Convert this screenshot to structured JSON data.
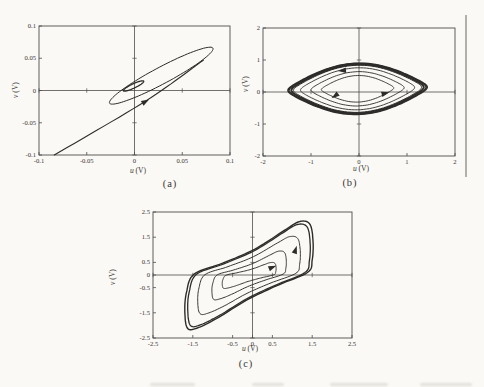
{
  "page": {
    "background": "#faf9f5",
    "ink": "#2e2c2a",
    "frame_color": "#4f4d4a",
    "label_color": "#3a3733"
  },
  "chart_data": [
    {
      "id": "a",
      "type": "line",
      "subtype": "phase-portrait",
      "caption": "(a)",
      "xlabel": {
        "var": "u",
        "unit": " (V)"
      },
      "ylabel": {
        "var": "v",
        "unit": " (V)"
      },
      "xlim": [
        -0.1,
        0.1
      ],
      "ylim": [
        -0.1,
        0.1
      ],
      "frame_px": {
        "l": 39,
        "t": 26,
        "r": 230,
        "b": 155
      },
      "x_ticks": {
        "values": [
          -0.1,
          -0.05,
          0,
          0.05,
          0.1
        ],
        "labels": [
          "-0.1",
          "-0.05",
          "0",
          "0.05",
          "0.1"
        ]
      },
      "y_ticks": {
        "values": [
          0.1,
          0.05,
          0,
          -0.05,
          -0.1
        ],
        "labels": [
          "0.1",
          "0.05",
          "0",
          "-0.05",
          "-0.1"
        ]
      },
      "label_pos": {
        "xlabel": [
          138,
          167
        ],
        "ylabel": [
          16,
          90
        ],
        "caption": [
          170,
          179
        ]
      },
      "series": [
        {
          "name": "transient-line",
          "type": "segment",
          "width": 1.1,
          "points": [
            [
              -0.084,
              -0.1
            ],
            [
              0.0115,
              -0.0165
            ],
            [
              0.072,
              0.047
            ]
          ]
        },
        {
          "name": "outer-ellipse-orbit",
          "type": "ellipse",
          "width": 1.0,
          "cx": 0.028,
          "cy": 0.023,
          "rx": 0.069,
          "ry": 0.0115,
          "angle_deg": 38.8
        },
        {
          "name": "inner-ellipse-orbit",
          "type": "ellipse",
          "width": 1.3,
          "cx": -0.001,
          "cy": 0.007,
          "rx": 0.013,
          "ry": 0.003,
          "angle_deg": 36
        }
      ],
      "arrows": [
        {
          "x": 0.0115,
          "y": -0.017,
          "dir_deg": 30
        }
      ]
    },
    {
      "id": "b",
      "type": "line",
      "subtype": "phase-portrait",
      "caption": "(b)",
      "xlabel": {
        "var": "u",
        "unit": " (V)"
      },
      "ylabel": {
        "var": "v",
        "unit": " (V)"
      },
      "xlim": [
        -2,
        2
      ],
      "ylim": [
        -2,
        2
      ],
      "frame_px": {
        "l": 263,
        "t": 28,
        "r": 455,
        "b": 156
      },
      "x_ticks": {
        "values": [
          -2,
          -1,
          0,
          1,
          2
        ],
        "labels": [
          "-2",
          "-1",
          "0",
          "1",
          "2"
        ]
      },
      "y_ticks": {
        "values": [
          2,
          1,
          0,
          -1,
          -2
        ],
        "labels": [
          "2",
          "1",
          "0",
          "-1",
          "-2"
        ]
      },
      "label_pos": {
        "xlabel": [
          361,
          165
        ],
        "ylabel": [
          246,
          84
        ],
        "caption": [
          350,
          178
        ]
      },
      "series": [
        {
          "name": "limit-cycle-spiral",
          "type": "lens_spiral",
          "cx": -0.03,
          "cy": 0.1,
          "rx": 1.45,
          "ry": 0.8,
          "pinch": 0.55,
          "tilt": 0.05,
          "loops": [
            {
              "s": 0.52,
              "w": 0.9
            },
            {
              "s": 0.67,
              "w": 0.9
            },
            {
              "s": 0.82,
              "w": 0.9
            },
            {
              "s": 0.92,
              "w": 1.0
            },
            {
              "s": 0.955,
              "w": 1.5
            },
            {
              "s": 0.985,
              "w": 1.5
            },
            {
              "s": 1.0,
              "w": 1.6
            },
            {
              "s": 0.945,
              "w": 1.2
            }
          ]
        }
      ],
      "arrows": [
        {
          "x": -0.35,
          "y": 0.67,
          "dir_deg": 185
        },
        {
          "x": -0.5,
          "y": -0.12,
          "dir_deg": 215
        },
        {
          "x": 0.55,
          "y": -0.04,
          "dir_deg": 15
        }
      ]
    },
    {
      "id": "c",
      "type": "line",
      "subtype": "phase-portrait",
      "caption": "(c)",
      "xlabel": {
        "var": "u",
        "unit": " (V)"
      },
      "ylabel": {
        "var": "v",
        "unit": " (V)"
      },
      "xlim": [
        -2.5,
        2.5
      ],
      "ylim": [
        -2.5,
        2.5
      ],
      "frame_px": {
        "l": 153,
        "t": 212,
        "r": 352,
        "b": 338
      },
      "x_ticks": {
        "values": [
          -2.5,
          -1.5,
          -0.5,
          0,
          0.5,
          1.5,
          2.5
        ],
        "labels": [
          "-2.5",
          "-1.5",
          "-0.5",
          "0",
          "0.5",
          "1.5",
          "2.5"
        ]
      },
      "y_ticks": {
        "values": [
          2.5,
          1.5,
          0.5,
          0,
          -0.5,
          -1.5,
          -2.5
        ],
        "labels": [
          "2.5",
          "1.5",
          "0.5",
          "0",
          "-0.5",
          "-1.5",
          "-2.5"
        ]
      },
      "label_pos": {
        "xlabel": [
          250,
          345
        ],
        "ylabel": [
          113,
          277
        ],
        "caption": [
          246,
          359
        ]
      },
      "series": [
        {
          "name": "limit-cycle-spiral",
          "type": "loop_spiral",
          "cx": -0.08,
          "cy": -0.02,
          "base": [
            [
              -1.47,
              0.03
            ],
            [
              -0.75,
              0.47
            ],
            [
              0.05,
              1.02
            ],
            [
              0.8,
              1.77
            ],
            [
              1.18,
              2.12
            ],
            [
              1.44,
              2.02
            ],
            [
              1.52,
              1.35
            ],
            [
              1.5,
              0.6
            ],
            [
              1.38,
              0.1
            ],
            [
              0.6,
              -0.43
            ],
            [
              -0.15,
              -1.0
            ],
            [
              -0.85,
              -1.68
            ],
            [
              -1.35,
              -2.08
            ],
            [
              -1.63,
              -2.12
            ],
            [
              -1.7,
              -1.45
            ],
            [
              -1.66,
              -0.7
            ]
          ],
          "loops": [
            {
              "sx": 1.0,
              "sy": 1.0,
              "w": 1.4
            },
            {
              "sx": 0.955,
              "sy": 0.945,
              "w": 1.3
            },
            {
              "sx": 0.8,
              "sy": 0.72,
              "w": 0.95
            },
            {
              "sx": 0.58,
              "sy": 0.45,
              "w": 0.95
            },
            {
              "sx": 0.42,
              "sy": 0.24,
              "w": 0.95
            }
          ]
        }
      ],
      "arrows": [
        {
          "x": 0.5,
          "y": 0.3,
          "dir_deg": 22
        },
        {
          "x": 1.08,
          "y": 1.0,
          "dir_deg": 72
        }
      ]
    }
  ],
  "artifacts": {
    "right_rule": {
      "x": 466,
      "y1": 15,
      "y2": 177,
      "color": "#959189",
      "width": 1.4
    },
    "bottom_smudges": {
      "y": 383,
      "color": "#b9b5ad",
      "items": [
        {
          "x": 150,
          "w": 45
        },
        {
          "x": 252,
          "w": 32
        },
        {
          "x": 330,
          "w": 58
        },
        {
          "x": 420,
          "w": 52
        }
      ]
    }
  }
}
